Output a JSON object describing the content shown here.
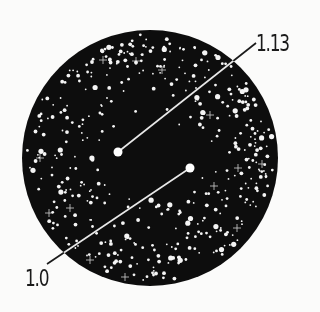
{
  "colors": {
    "background": "#fbfbfa",
    "disk": "#0d0d0d",
    "star": "#f4f4f4",
    "leader": "#e8e8e8",
    "label": "#1a1a1a"
  },
  "disk": {
    "cx": 150,
    "cy": 158,
    "r": 128
  },
  "markers": [
    {
      "id": "marker-1-13",
      "label": "1.13",
      "point": {
        "x": 118,
        "y": 152,
        "r": 4.5
      },
      "line_end": {
        "x": 256,
        "y": 43
      },
      "label_pos": {
        "x": 256,
        "y": 32
      }
    },
    {
      "id": "marker-1-0",
      "label": "1.0",
      "point": {
        "x": 190,
        "y": 168,
        "r": 4.5
      },
      "line_end": {
        "x": 47,
        "y": 264
      },
      "label_pos": {
        "x": 25,
        "y": 267
      }
    }
  ],
  "stars": {
    "seed": 7,
    "count": 430,
    "ring_inner": 40,
    "ring_outer": 122,
    "sparkles": [
      [
        70,
        208
      ],
      [
        90,
        260
      ],
      [
        125,
        277
      ],
      [
        210,
        115
      ],
      [
        238,
        168
      ],
      [
        237,
        228
      ],
      [
        262,
        164
      ],
      [
        49,
        213
      ],
      [
        103,
        60
      ],
      [
        136,
        61
      ],
      [
        162,
        70
      ],
      [
        214,
        186
      ],
      [
        40,
        158
      ]
    ]
  }
}
